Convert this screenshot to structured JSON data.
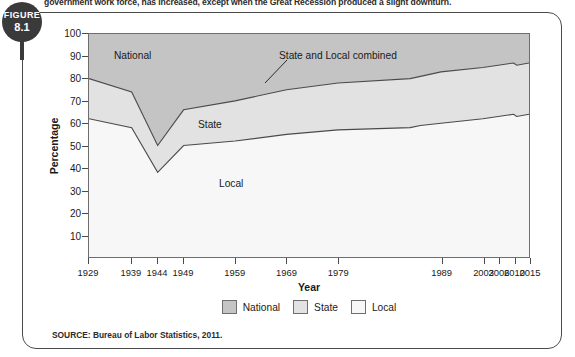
{
  "caption": {
    "text": "government work force, has increased, except when the Great Recession produced a slight downturn."
  },
  "figure_badge": {
    "word": "FIGURE",
    "number": "8.1"
  },
  "source": {
    "text": "SOURCE: Bureau of Labor Statistics, 2011."
  },
  "legend": {
    "items": [
      {
        "label": "National",
        "color": "#c4c4c4"
      },
      {
        "label": "State",
        "color": "#e2e2e2"
      },
      {
        "label": "Local",
        "color": "#f7f7f7"
      }
    ]
  },
  "annotations": {
    "national": "National",
    "state_local_combined": "State and Local combined",
    "state": "State",
    "local": "Local"
  },
  "chart_data": {
    "type": "area",
    "stacked": true,
    "title": "",
    "xlabel": "Year",
    "ylabel": "Percentage",
    "ylim": [
      0,
      100
    ],
    "yticks": [
      10,
      20,
      30,
      40,
      50,
      60,
      70,
      80,
      90,
      100
    ],
    "grid": false,
    "legend_position": "bottom-center",
    "x": [
      1929,
      1939,
      1944,
      1949,
      1959,
      1969,
      1979,
      1986,
      1987,
      1989,
      2003,
      2006,
      2010,
      2011,
      2015
    ],
    "xtick_labels": [
      "1929",
      "1939",
      "1944",
      "1949",
      "1959",
      "1969",
      "1979",
      "1989",
      "2003",
      "2006",
      "2010",
      "2015"
    ],
    "xtick_years": [
      1929,
      1939,
      1944,
      1949,
      1959,
      1969,
      1979,
      1989,
      2003,
      2006,
      2010,
      2015
    ],
    "series": [
      {
        "name": "Local",
        "values": [
          62,
          58,
          38,
          50,
          52,
          55,
          57,
          58,
          59,
          60,
          62,
          63,
          64,
          63,
          64
        ]
      },
      {
        "name": "State",
        "values": [
          18,
          16,
          12,
          16,
          18,
          20,
          21,
          22,
          22,
          23,
          23,
          23,
          23,
          23,
          23
        ]
      },
      {
        "name": "National",
        "values": [
          20,
          26,
          50,
          34,
          30,
          25,
          22,
          20,
          19,
          17,
          15,
          14,
          13,
          14,
          13
        ]
      }
    ],
    "boundaries": {
      "state_and_local_combined": [
        80,
        74,
        50,
        66,
        70,
        75,
        78,
        80,
        81,
        83,
        85,
        86,
        87,
        86,
        87
      ],
      "local_only": [
        62,
        58,
        38,
        50,
        52,
        55,
        57,
        58,
        59,
        60,
        62,
        63,
        64,
        63,
        64
      ]
    }
  }
}
